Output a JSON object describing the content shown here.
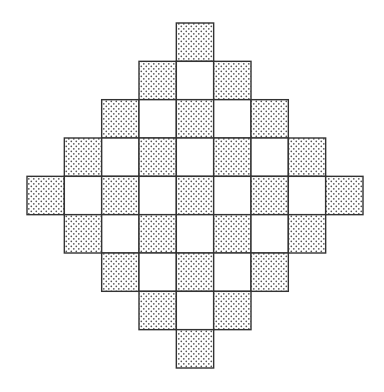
{
  "diagram": {
    "type": "checkered-diamond",
    "grid_size": 9,
    "row_cell_counts": [
      1,
      3,
      5,
      7,
      9,
      7,
      5,
      3,
      1
    ],
    "pattern": "checkerboard: cell shaded when (row + column) is even",
    "shaded_fill": "stippled dots",
    "unshaded_fill": "white",
    "colors": {
      "background": "#ffffff",
      "line": "#333333",
      "dot": "#555555"
    }
  }
}
